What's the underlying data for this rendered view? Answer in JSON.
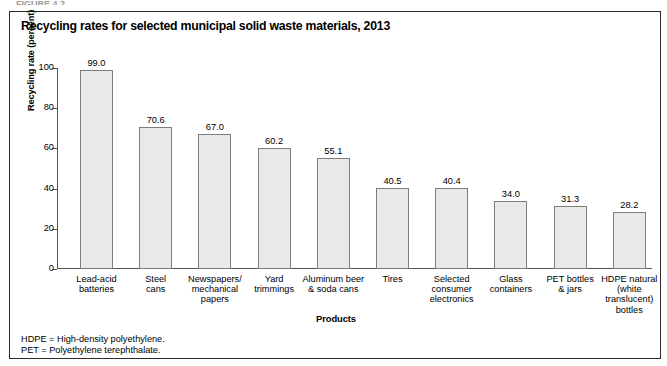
{
  "figure_caption_partial": "FIGURE 4.2",
  "chart_title": "Recycling rates for selected municipal solid waste materials, 2013",
  "axis": {
    "y_title": "Recycling rate (percent)",
    "x_title": "Products",
    "y_ticks": [
      "100",
      "80",
      "60",
      "40",
      "20",
      "0"
    ]
  },
  "footnotes": [
    "HDPE = High-density polyethylene.",
    "PET = Polyethylene terephthalate."
  ],
  "colors": {
    "bar_fill": "#e9e9e9",
    "bar_border": "#7d7d7d",
    "axis": "#555555",
    "frame": "#2b2b2b"
  },
  "chart_data": {
    "type": "bar",
    "title": "Recycling rates for selected municipal solid waste materials, 2013",
    "xlabel": "Products",
    "ylabel": "Recycling rate (percent)",
    "ylim": [
      0,
      100
    ],
    "yticks": [
      0,
      20,
      40,
      60,
      80,
      100
    ],
    "grid": false,
    "legend": false,
    "categories": [
      "Lead-acid batteries",
      "Steel cans",
      "Newspapers/ mechanical papers",
      "Yard trimmings",
      "Aluminum beer & soda cans",
      "Tires",
      "Selected consumer electronics",
      "Glass containers",
      "PET bottles & jars",
      "HDPE natural (white translucent) bottles"
    ],
    "category_lines": [
      [
        "Lead-acid",
        "batteries"
      ],
      [
        "Steel",
        "cans"
      ],
      [
        "Newspapers/",
        "mechanical",
        "papers"
      ],
      [
        "Yard",
        "trimmings"
      ],
      [
        "Aluminum beer",
        "& soda cans"
      ],
      [
        "Tires"
      ],
      [
        "Selected",
        "consumer",
        "electronics"
      ],
      [
        "Glass",
        "containers"
      ],
      [
        "PET bottles",
        "& jars"
      ],
      [
        "HDPE natural",
        "(white translucent)",
        "bottles"
      ]
    ],
    "values": [
      99.0,
      70.6,
      67.0,
      60.2,
      55.1,
      40.5,
      40.4,
      34.0,
      31.3,
      28.2
    ],
    "value_labels": [
      "99.0",
      "70.6",
      "67.0",
      "60.2",
      "55.1",
      "40.5",
      "40.4",
      "34.0",
      "31.3",
      "28.2"
    ]
  }
}
